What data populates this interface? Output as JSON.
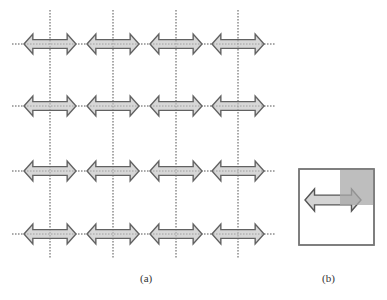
{
  "figure": {
    "panel_a": {
      "caption": "(a)",
      "grid_rows": 4,
      "grid_cols": 4,
      "element": "double-headed-arrow",
      "guide_lines": "dotted"
    },
    "panel_b": {
      "caption": "(b)",
      "element": "double-headed-arrow",
      "overlay": "gray-square-top-right"
    }
  },
  "colors": {
    "arrow_fill": "#d4d4d4",
    "arrow_stroke": "#555555",
    "guide_line": "#777777",
    "box_stroke": "#777777",
    "overlay_fill": "#a8a8a8"
  }
}
